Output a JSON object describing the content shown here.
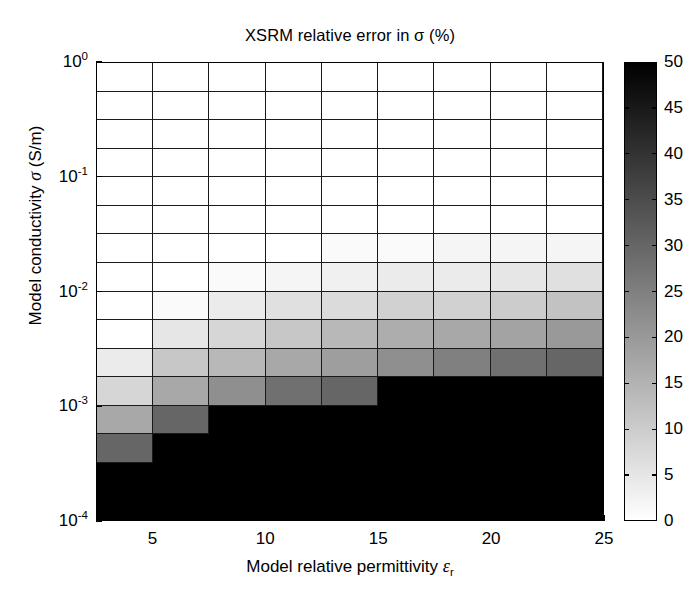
{
  "chart_data": {
    "type": "heatmap",
    "title": "XSRM relative error in σ (%)",
    "xlabel": "Model relative permittivity εr",
    "xlabel_parts": {
      "text": "Model relative permittivity ",
      "symbol": "ε",
      "subscript": "r"
    },
    "ylabel": "Model conductivity σ (S/m)",
    "ylabel_parts": {
      "prefix": "Model conductivity ",
      "symbol": "σ",
      "suffix": " (S/m)"
    },
    "xscale": "linear",
    "yscale": "log",
    "xlim": [
      2.5,
      25
    ],
    "ylim": [
      0.0001,
      1
    ],
    "grid": true,
    "xticks": [
      5,
      10,
      15,
      20,
      25
    ],
    "xticklabels": [
      "5",
      "10",
      "15",
      "20",
      "25"
    ],
    "yticks": [
      1,
      0.1,
      0.01,
      0.001,
      0.0001
    ],
    "yticklabels": [
      "10⁰",
      "10⁻¹",
      "10⁻²",
      "10⁻³",
      "10⁻⁴"
    ],
    "ytick_mantissa": "10",
    "ytick_exponents": [
      "0",
      "-1",
      "-2",
      "-3",
      "-4"
    ],
    "x_centers": [
      3.75,
      6.25,
      8.75,
      11.25,
      13.75,
      16.25,
      18.75,
      21.25,
      23.75
    ],
    "x_edges": [
      2.5,
      5,
      7.5,
      10,
      12.5,
      15,
      17.5,
      20,
      22.5,
      25
    ],
    "y_edges_log10": [
      0.0,
      -0.25,
      -0.5,
      -0.75,
      -1.0,
      -1.25,
      -1.5,
      -1.75,
      -2.0,
      -2.25,
      -2.5,
      -2.75,
      -3.0,
      -3.25,
      -3.5,
      -3.75,
      -4.0
    ],
    "y_row_labels": [
      "1e0",
      "5.6e-1",
      "3.2e-1",
      "1.8e-1",
      "1e-1",
      "5.6e-2",
      "3.2e-2",
      "1.8e-2",
      "1e-2",
      "5.6e-3",
      "3.2e-3",
      "1.8e-3",
      "1e-3",
      "5.6e-4",
      "3.2e-4",
      "1.8e-4"
    ],
    "z_unit": "%",
    "values_note": "16 rows (top = sigma 1 S/m) x 9 columns (left = eps_r 2.5-5), relative error in percent",
    "values": [
      [
        0,
        0,
        0,
        0,
        0,
        0,
        0,
        0,
        0
      ],
      [
        0,
        0,
        0,
        0,
        0,
        0,
        0,
        0,
        0
      ],
      [
        0,
        0,
        0,
        0,
        0,
        0,
        0,
        0,
        0
      ],
      [
        0,
        0,
        0,
        0,
        0,
        0,
        0,
        0,
        0
      ],
      [
        0,
        0,
        0,
        0,
        0,
        0,
        0,
        0,
        0
      ],
      [
        0,
        0,
        0,
        0,
        0,
        0,
        0,
        0,
        0
      ],
      [
        0,
        0,
        0,
        0,
        1,
        1,
        2,
        2,
        2
      ],
      [
        0,
        0,
        1,
        2,
        3,
        4,
        4,
        5,
        6
      ],
      [
        0,
        1,
        4,
        6,
        7,
        9,
        9,
        10,
        12
      ],
      [
        0,
        5,
        8,
        11,
        14,
        16,
        17,
        18,
        20
      ],
      [
        4,
        11,
        14,
        17,
        19,
        22,
        25,
        28,
        30
      ],
      [
        8,
        17,
        22,
        28,
        30,
        50,
        50,
        50,
        50
      ],
      [
        17,
        30,
        50,
        50,
        50,
        50,
        50,
        50,
        50
      ],
      [
        30,
        50,
        50,
        50,
        50,
        50,
        50,
        50,
        50
      ],
      [
        50,
        50,
        50,
        50,
        50,
        50,
        50,
        50,
        50
      ],
      [
        50,
        50,
        50,
        50,
        50,
        50,
        50,
        50,
        50
      ]
    ],
    "colorbar": {
      "label": "",
      "min": 0,
      "max": 50,
      "ticks": [
        0,
        5,
        10,
        15,
        20,
        25,
        30,
        35,
        40,
        45,
        50
      ],
      "ticklabels": [
        "0",
        "5",
        "10",
        "15",
        "20",
        "25",
        "30",
        "35",
        "40",
        "45",
        "50"
      ],
      "colormap": "gray-inverted",
      "low_color": "#ffffff",
      "high_color": "#000000",
      "position": "right"
    },
    "axis_color": "#000000",
    "background_color": "#ffffff"
  }
}
